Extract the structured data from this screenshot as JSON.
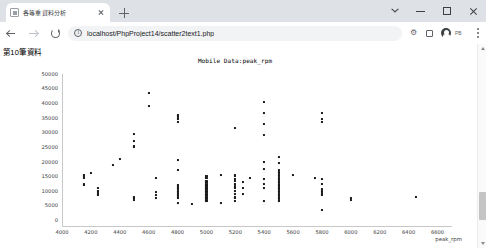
{
  "browser": {
    "tab": {
      "title": "各等重資料分析",
      "favicon": "document-icon",
      "close": "close-icon"
    },
    "new_tab_label": "+",
    "window_controls": {
      "chevron": "chevron-down-icon",
      "minimize": "minimize-icon",
      "maximize": "maximize-icon",
      "close": "close-icon"
    },
    "nav": {
      "back": "back-arrow-icon",
      "forward": "forward-arrow-icon",
      "reload": "reload-icon"
    },
    "omnibox": {
      "info_icon": "info-circle-icon",
      "url": "localhost/PhpProject14/scatter2text1.php"
    },
    "toolbar_icons": {
      "extensions": "puzzle-icon",
      "sidepanel": "side-panel-icon",
      "profile": "avatar-icon",
      "profile_badge": "PB",
      "menu": "kebab-menu-icon"
    }
  },
  "page": {
    "heading": "第10筆資料"
  },
  "scrollbar": {
    "up": "scroll-up-arrow",
    "down": "scroll-down-arrow",
    "thumb": "scroll-thumb"
  },
  "chart_data": {
    "type": "scatter",
    "title": "Mobile Data:peak_rpm",
    "xlabel": "peak_rpm",
    "ylabel": "",
    "xlim": [
      4000,
      6700
    ],
    "ylim": [
      0,
      52000
    ],
    "xticks": [
      4000,
      4200,
      4400,
      4600,
      4800,
      5000,
      5200,
      5400,
      5600,
      5800,
      6000,
      6200,
      6400,
      6600
    ],
    "yticks": [
      0,
      5000,
      10000,
      15000,
      20000,
      25000,
      30000,
      35000,
      40000,
      45000,
      50000
    ],
    "grid": false,
    "legend": "none",
    "points": [
      [
        4150,
        16500
      ],
      [
        4150,
        17000
      ],
      [
        4150,
        17500
      ],
      [
        4150,
        14500
      ],
      [
        4150,
        14000
      ],
      [
        4200,
        18000
      ],
      [
        4250,
        11500
      ],
      [
        4250,
        11000
      ],
      [
        4250,
        10500
      ],
      [
        4250,
        12000
      ],
      [
        4250,
        13000
      ],
      [
        4350,
        21000
      ],
      [
        4400,
        23000
      ],
      [
        4500,
        9500
      ],
      [
        4500,
        9000
      ],
      [
        4500,
        10000
      ],
      [
        4500,
        29000
      ],
      [
        4500,
        27500
      ],
      [
        4500,
        27000
      ],
      [
        4500,
        31500
      ],
      [
        4600,
        45500
      ],
      [
        4600,
        41000
      ],
      [
        4650,
        16500
      ],
      [
        4650,
        11500
      ],
      [
        4650,
        10500
      ],
      [
        4650,
        9500
      ],
      [
        4800,
        36500
      ],
      [
        4800,
        37000
      ],
      [
        4800,
        37500
      ],
      [
        4800,
        38000
      ],
      [
        4800,
        35500
      ],
      [
        4800,
        22500
      ],
      [
        4800,
        19000
      ],
      [
        4800,
        12500
      ],
      [
        4800,
        12000
      ],
      [
        4800,
        11500
      ],
      [
        4800,
        11000
      ],
      [
        4800,
        10500
      ],
      [
        4800,
        10000
      ],
      [
        4800,
        9500
      ],
      [
        4800,
        13000
      ],
      [
        4800,
        13500
      ],
      [
        4800,
        14000
      ],
      [
        4800,
        8000
      ],
      [
        4900,
        7500
      ],
      [
        5000,
        16500
      ],
      [
        5000,
        15500
      ],
      [
        5000,
        15000
      ],
      [
        5000,
        14500
      ],
      [
        5000,
        14000
      ],
      [
        5000,
        13500
      ],
      [
        5000,
        13000
      ],
      [
        5000,
        12500
      ],
      [
        5000,
        12000
      ],
      [
        5000,
        11500
      ],
      [
        5000,
        11000
      ],
      [
        5000,
        10500
      ],
      [
        5000,
        10000
      ],
      [
        5000,
        9500
      ],
      [
        5000,
        9000
      ],
      [
        5000,
        8500
      ],
      [
        5000,
        17000
      ],
      [
        5100,
        8000
      ],
      [
        5100,
        17500
      ],
      [
        5200,
        33500
      ],
      [
        5200,
        17500
      ],
      [
        5200,
        17000
      ],
      [
        5200,
        16000
      ],
      [
        5200,
        15500
      ],
      [
        5200,
        14500
      ],
      [
        5200,
        13500
      ],
      [
        5200,
        13000
      ],
      [
        5200,
        12000
      ],
      [
        5200,
        11000
      ],
      [
        5200,
        10000
      ],
      [
        5200,
        9500
      ],
      [
        5200,
        8500
      ],
      [
        5250,
        15000
      ],
      [
        5250,
        13000
      ],
      [
        5250,
        11000
      ],
      [
        5300,
        16500
      ],
      [
        5400,
        42500
      ],
      [
        5400,
        38500
      ],
      [
        5400,
        35000
      ],
      [
        5400,
        31000
      ],
      [
        5400,
        22000
      ],
      [
        5400,
        19500
      ],
      [
        5400,
        16000
      ],
      [
        5400,
        14500
      ],
      [
        5400,
        13000
      ],
      [
        5400,
        8500
      ],
      [
        5500,
        23500
      ],
      [
        5500,
        21500
      ],
      [
        5500,
        19000
      ],
      [
        5500,
        18500
      ],
      [
        5500,
        18000
      ],
      [
        5500,
        17500
      ],
      [
        5500,
        17000
      ],
      [
        5500,
        16500
      ],
      [
        5500,
        16000
      ],
      [
        5500,
        15500
      ],
      [
        5500,
        15000
      ],
      [
        5500,
        14500
      ],
      [
        5500,
        14000
      ],
      [
        5500,
        13500
      ],
      [
        5500,
        13000
      ],
      [
        5500,
        12500
      ],
      [
        5500,
        12000
      ],
      [
        5500,
        11500
      ],
      [
        5500,
        11000
      ],
      [
        5500,
        10500
      ],
      [
        5500,
        10000
      ],
      [
        5500,
        9500
      ],
      [
        5500,
        9000
      ],
      [
        5500,
        8500
      ],
      [
        5600,
        17500
      ],
      [
        5750,
        16500
      ],
      [
        5800,
        38500
      ],
      [
        5800,
        36500
      ],
      [
        5800,
        35500
      ],
      [
        5800,
        16000
      ],
      [
        5800,
        14500
      ],
      [
        5800,
        12500
      ],
      [
        5800,
        12000
      ],
      [
        5800,
        11500
      ],
      [
        5800,
        11000
      ],
      [
        5800,
        10500
      ],
      [
        5800,
        5500
      ],
      [
        6000,
        9500
      ],
      [
        6000,
        9000
      ],
      [
        6450,
        10000
      ]
    ]
  }
}
